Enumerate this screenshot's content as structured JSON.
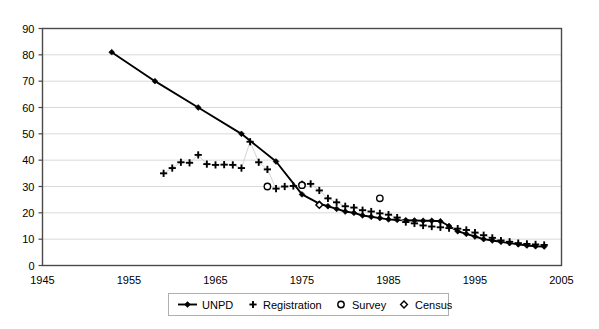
{
  "chart_data": {
    "type": "line",
    "title": "",
    "subtitle": "",
    "xlabel": "",
    "ylabel": "",
    "xlim": [
      1945,
      2005
    ],
    "ylim": [
      0,
      90
    ],
    "xticks": [
      "1945",
      "1955",
      "1965",
      "1975",
      "1985",
      "1995",
      "2005"
    ],
    "xtick_values": [
      1945,
      1955,
      1965,
      1975,
      1985,
      1995,
      2005
    ],
    "yticks": [
      "0",
      "10",
      "20",
      "30",
      "40",
      "50",
      "60",
      "70",
      "80",
      "90"
    ],
    "ytick_values": [
      0,
      10,
      20,
      30,
      40,
      50,
      60,
      70,
      80,
      90
    ],
    "grid": "horizontal",
    "legend_position": "bottom",
    "series": [
      {
        "name": "UNPD",
        "marker": "filled-diamond",
        "style": "line-with-markers",
        "color": "#000000",
        "x": [
          1953,
          1958,
          1963,
          1968,
          1972,
          1975,
          1977,
          1978,
          1979,
          1980,
          1981,
          1982,
          1983,
          1984,
          1985,
          1986,
          1987,
          1988,
          1989,
          1990,
          1991,
          1992,
          1993,
          1994,
          1995,
          1996,
          1997,
          1998,
          1999,
          2000,
          2001,
          2002,
          2003
        ],
        "y": [
          81,
          70,
          60,
          50,
          39.5,
          27,
          23.5,
          22.5,
          21.5,
          20.5,
          20,
          19,
          18.5,
          18,
          17.5,
          17.3,
          17.2,
          17.1,
          17,
          17,
          16.8,
          15,
          13,
          12,
          11,
          10,
          9.5,
          9,
          8.5,
          8,
          7.6,
          7.3,
          7.2
        ]
      },
      {
        "name": "Registration",
        "marker": "plus",
        "style": "markers-only",
        "color": "#000000",
        "x": [
          1959,
          1960,
          1961,
          1962,
          1963,
          1964,
          1965,
          1966,
          1967,
          1968,
          1969,
          1970,
          1971,
          1972,
          1973,
          1974,
          1975,
          1976,
          1977,
          1978,
          1979,
          1980,
          1981,
          1982,
          1983,
          1984,
          1985,
          1986,
          1987,
          1988,
          1989,
          1990,
          1991,
          1992,
          1993,
          1994,
          1995,
          1996,
          1997,
          1998,
          1999,
          2000,
          2001,
          2002,
          2003
        ],
        "y": [
          35,
          37,
          39.2,
          39,
          42,
          38.5,
          38.2,
          38.3,
          38.2,
          37,
          47,
          39.2,
          36.5,
          29.2,
          30,
          30.2,
          30.8,
          31,
          28.5,
          25.5,
          24,
          22.5,
          22,
          21,
          20.5,
          19.8,
          19.3,
          18.2,
          16.5,
          16,
          15.2,
          14.8,
          14.5,
          14.2,
          14,
          13.5,
          12.5,
          11.5,
          10.5,
          9.5,
          9,
          8.5,
          8.2,
          8,
          7.8
        ]
      },
      {
        "name": "Survey",
        "marker": "open-circle",
        "style": "markers-only",
        "color": "#000000",
        "x": [
          1971,
          1975,
          1984
        ],
        "y": [
          30,
          30.5,
          25.5
        ]
      },
      {
        "name": "Census",
        "marker": "open-diamond",
        "style": "markers-only",
        "color": "#000000",
        "x": [
          1977
        ],
        "y": [
          23
        ]
      }
    ]
  },
  "legend": {
    "items": [
      {
        "label": "UNPD",
        "marker": "line-filled-diamond"
      },
      {
        "label": "Registration",
        "marker": "plus"
      },
      {
        "label": "Survey",
        "marker": "open-circle"
      },
      {
        "label": "Census",
        "marker": "open-diamond"
      }
    ]
  },
  "colors": {
    "axis": "#4a4a4a",
    "grid": "#d9d9d9",
    "series": "#000000",
    "background": "#ffffff",
    "legend_border": "#b0b0b0"
  }
}
